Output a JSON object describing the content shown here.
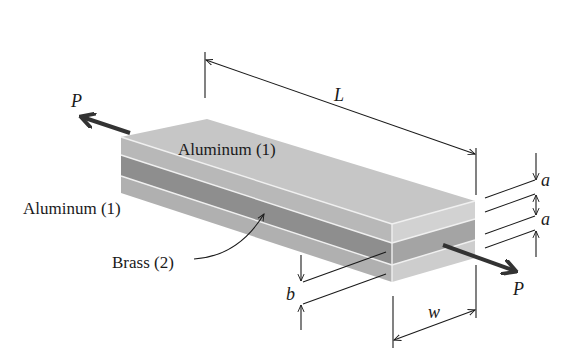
{
  "figure": {
    "type": "isometric layered bar under axial load",
    "colors": {
      "aluminum_top": "#c4c4c4",
      "aluminum_side": "#b5b5b5",
      "aluminum_front": "#cfcfcf",
      "brass_side": "#8f8f8f",
      "brass_front": "#a3a3a3",
      "separator": "#f2f2f2",
      "ink": "#1a1a1a"
    }
  },
  "labels": {
    "aluminum_top": "Aluminum (1)",
    "aluminum_left": "Aluminum (1)",
    "brass": "Brass (2)"
  },
  "dimensions": {
    "length": "L",
    "width": "w",
    "brass_thickness": "b",
    "aluminum_thickness_top": "a",
    "aluminum_thickness_bottom": "a"
  },
  "loads": {
    "left": "P",
    "right": "P"
  }
}
